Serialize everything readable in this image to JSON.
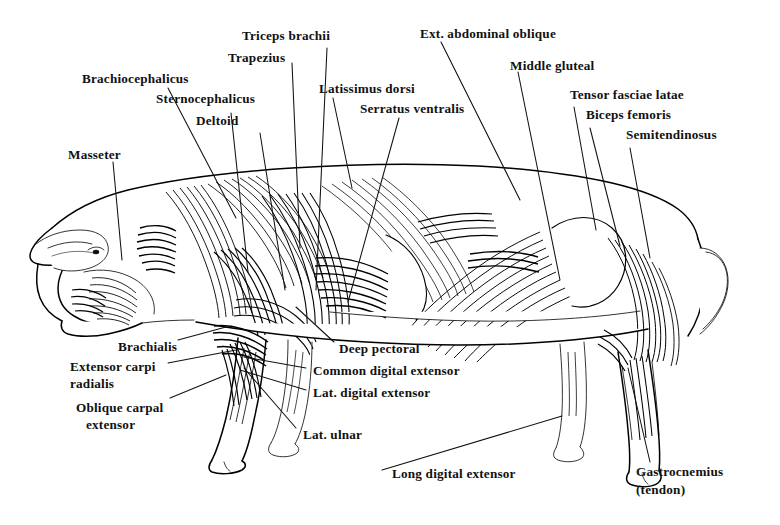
{
  "figure": {
    "view": "lateral left side",
    "style": "black and white line engraving with hatching",
    "background_color": "#ffffff",
    "ink_color": "#111111",
    "label_count": 21
  },
  "labels": {
    "masseter": "Masseter",
    "brachiocephalicus": "Brachiocephalicus",
    "sternocephalicus": "Sternocephalicus",
    "deltoid": "Deltoid",
    "trapezius": "Trapezius",
    "triceps_brachii": "Triceps brachii",
    "latissimus_dorsi": "Latissimus dorsi",
    "serratus_ventralis": "Serratus ventralis",
    "ext_abdominal_oblique": "Ext. abdominal oblique",
    "middle_gluteal": "Middle gluteal",
    "tensor_fasciae_latae": "Tensor fasciae latae",
    "biceps_femoris": "Biceps femoris",
    "semitendinosus": "Semitendinosus",
    "brachialis": "Brachialis",
    "extensor_carpi_line1": "Extensor carpi",
    "extensor_carpi_line2": "radialis",
    "oblique_carpal_line1": "Oblique carpal",
    "oblique_carpal_line2": "extensor",
    "deep_pectoral": "Deep pectoral",
    "common_digital_extensor": "Common digital extensor",
    "lat_digital_extensor": "Lat. digital extensor",
    "lat_ulnar": "Lat. ulnar",
    "long_digital_extensor": "Long digital extensor",
    "gastrocnemius_line1": "Gastrocnemius",
    "gastrocnemius_line2": "(tendon)"
  }
}
